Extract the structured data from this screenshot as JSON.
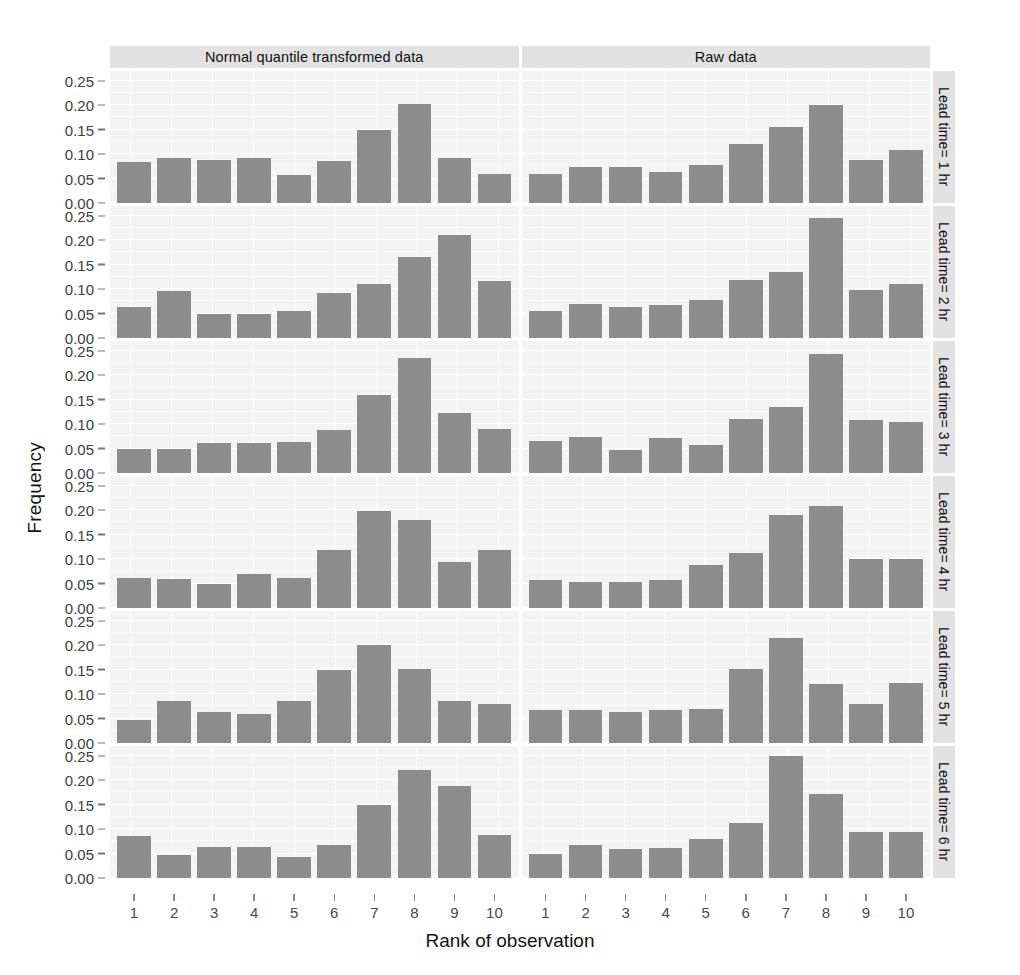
{
  "chart_data": {
    "type": "bar",
    "title": "",
    "xlabel": "Rank of observation",
    "ylabel": "Frequency",
    "ylim": [
      0,
      0.27
    ],
    "ytick_labels": [
      "0.00",
      "0.05",
      "0.10",
      "0.15",
      "0.20",
      "0.25"
    ],
    "ytick_values": [
      0.0,
      0.05,
      0.1,
      0.15,
      0.2,
      0.25
    ],
    "categories": [
      "1",
      "2",
      "3",
      "4",
      "5",
      "6",
      "7",
      "8",
      "9",
      "10"
    ],
    "grid": true,
    "legend": "none",
    "bar_color": "#8c8c8c",
    "panel_bg": "#f4f4f4",
    "strip_bg": "#e2e2e2",
    "col_strips": [
      "Normal quantile transformed data",
      "Raw data"
    ],
    "row_strips": [
      "Lead time= 1 hr",
      "Lead time= 2 hr",
      "Lead time= 3 hr",
      "Lead time= 4 hr",
      "Lead time= 5 hr",
      "Lead time= 6 hr"
    ],
    "panels": [
      {
        "row": "Lead time= 1 hr",
        "column": "Normal quantile transformed data",
        "values": [
          0.083,
          0.093,
          0.087,
          0.093,
          0.058,
          0.085,
          0.15,
          0.202,
          0.092,
          0.06
        ]
      },
      {
        "row": "Lead time= 1 hr",
        "column": "Raw data",
        "values": [
          0.06,
          0.073,
          0.073,
          0.064,
          0.077,
          0.12,
          0.155,
          0.201,
          0.087,
          0.108
        ]
      },
      {
        "row": "Lead time= 2 hr",
        "column": "Normal quantile transformed data",
        "values": [
          0.064,
          0.097,
          0.049,
          0.049,
          0.056,
          0.092,
          0.11,
          0.165,
          0.21,
          0.117
        ]
      },
      {
        "row": "Lead time= 2 hr",
        "column": "Raw data",
        "values": [
          0.056,
          0.069,
          0.064,
          0.067,
          0.078,
          0.119,
          0.136,
          0.245,
          0.098,
          0.11
        ]
      },
      {
        "row": "Lead time= 3 hr",
        "column": "Normal quantile transformed data",
        "values": [
          0.05,
          0.05,
          0.062,
          0.062,
          0.063,
          0.088,
          0.16,
          0.236,
          0.123,
          0.091
        ]
      },
      {
        "row": "Lead time= 3 hr",
        "column": "Raw data",
        "values": [
          0.065,
          0.074,
          0.048,
          0.071,
          0.058,
          0.111,
          0.136,
          0.243,
          0.108,
          0.104
        ]
      },
      {
        "row": "Lead time= 4 hr",
        "column": "Normal quantile transformed data",
        "values": [
          0.062,
          0.059,
          0.05,
          0.07,
          0.062,
          0.118,
          0.198,
          0.181,
          0.095,
          0.118
        ]
      },
      {
        "row": "Lead time= 4 hr",
        "column": "Raw data",
        "values": [
          0.058,
          0.054,
          0.054,
          0.057,
          0.088,
          0.113,
          0.19,
          0.208,
          0.101,
          0.101
        ]
      },
      {
        "row": "Lead time= 5 hr",
        "column": "Normal quantile transformed data",
        "values": [
          0.047,
          0.085,
          0.063,
          0.06,
          0.085,
          0.15,
          0.2,
          0.152,
          0.086,
          0.08
        ]
      },
      {
        "row": "Lead time= 5 hr",
        "column": "Raw data",
        "values": [
          0.068,
          0.068,
          0.063,
          0.068,
          0.07,
          0.152,
          0.215,
          0.12,
          0.079,
          0.123
        ]
      },
      {
        "row": "Lead time= 6 hr",
        "column": "Normal quantile transformed data",
        "values": [
          0.085,
          0.048,
          0.063,
          0.063,
          0.042,
          0.067,
          0.15,
          0.221,
          0.188,
          0.088
        ]
      },
      {
        "row": "Lead time= 6 hr",
        "column": "Raw data",
        "values": [
          0.05,
          0.067,
          0.06,
          0.062,
          0.08,
          0.113,
          0.25,
          0.172,
          0.095,
          0.095
        ]
      }
    ]
  }
}
